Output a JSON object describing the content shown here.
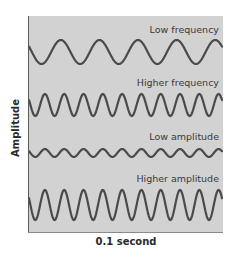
{
  "figure": {
    "y_axis_label": "Amplitude",
    "x_axis_label": "0.1 second",
    "colors": {
      "panel_bg": "#d2d2d2",
      "wave_stroke": "#4a4a4a",
      "text": "#2a2a2a"
    },
    "waves": [
      {
        "label": "Low frequency",
        "cycles": 5,
        "amplitude_px": 12,
        "center_y": 52,
        "label_y": 24
      },
      {
        "label": "Higher frequency",
        "cycles": 10,
        "amplitude_px": 11,
        "center_y": 105,
        "label_y": 77
      },
      {
        "label": "Low amplitude",
        "cycles": 10,
        "amplitude_px": 4,
        "center_y": 153,
        "label_y": 131
      },
      {
        "label": "Higher amplitude",
        "cycles": 10,
        "amplitude_px": 15,
        "center_y": 205,
        "label_y": 173
      }
    ]
  }
}
